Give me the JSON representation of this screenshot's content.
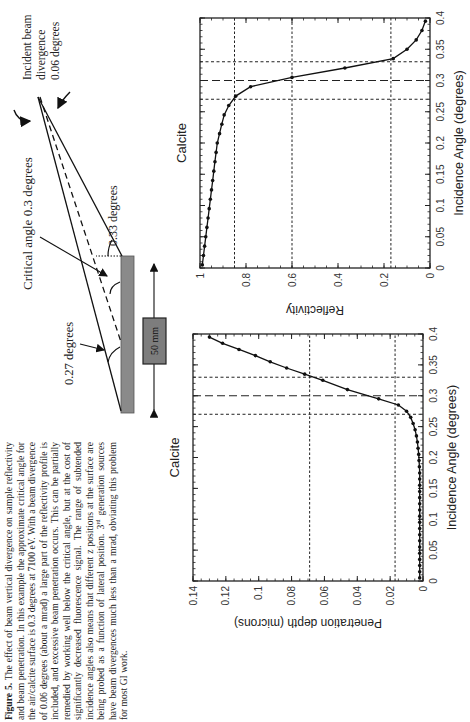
{
  "figure": {
    "label": "Figure 5.",
    "caption_lines": [
      "The effect of beam vertical divergence on sample",
      "reflectivity and beam penetration. In this example the",
      "approximate critical angle for the air/calcite surface is 0.3",
      "degrees at 7100 eV. With a beam divergence of 0.06 degrees",
      "(about a mrad) a large part of the reflectivity profile is included,",
      "and excessive beam penetration occurs. This can be partially",
      "remedied by working well below the critical angle, but at the",
      "cost of significantly decreased fluorescence signal. The range of",
      "subtended incidence angles also means that different z positions",
      "at the surface are being probed as a function of lateral position.",
      "generation sources have beam divergences much less than a",
      "mrad, obviating this problem for most GI work."
    ],
    "caption_superscript_prefix": "3",
    "caption_superscript": "rd"
  },
  "diagram": {
    "label_incident": [
      "Incident beam",
      "divergence",
      "0.06 degrees"
    ],
    "label_critical": "Critical angle  0.3 degrees",
    "label_033": "0.33 degrees",
    "label_027": "0.27 degrees",
    "label_size": "50 mm"
  },
  "chart_data": [
    {
      "type": "line",
      "title": "Calcite",
      "xlabel": "Incidence Angle (degrees)",
      "ylabel": "Reflectivity",
      "xlim": [
        0,
        0.4
      ],
      "ylim": [
        0,
        1
      ],
      "x_ticks": [
        "0",
        "0.05",
        "0.1",
        "0.15",
        "0.2",
        "0.25",
        "0.3",
        "0.35",
        "0.4"
      ],
      "y_ticks": [
        "0",
        "0.2",
        "0.4",
        "0.6",
        "0.8",
        "1"
      ],
      "grid": false,
      "markers": true,
      "x": [
        0.005,
        0.02,
        0.035,
        0.05,
        0.065,
        0.08,
        0.095,
        0.11,
        0.125,
        0.14,
        0.155,
        0.17,
        0.185,
        0.2,
        0.215,
        0.23,
        0.245,
        0.26,
        0.275,
        0.29,
        0.305,
        0.32,
        0.335,
        0.35,
        0.365,
        0.38,
        0.395
      ],
      "values": [
        0.99,
        0.985,
        0.98,
        0.975,
        0.97,
        0.965,
        0.96,
        0.955,
        0.95,
        0.945,
        0.94,
        0.935,
        0.93,
        0.925,
        0.915,
        0.905,
        0.895,
        0.875,
        0.845,
        0.78,
        0.6,
        0.37,
        0.16,
        0.1,
        0.06,
        0.035,
        0.02
      ],
      "reference_lines": {
        "vertical_dashed_angles": [
          0.27,
          0.3,
          0.33
        ],
        "horizontal_dotted_reflectivity": [
          0.85,
          0.6,
          0.17
        ]
      }
    },
    {
      "type": "line",
      "title": "Calcite",
      "xlabel": "Incidence Angle (degrees)",
      "ylabel": "Penetration depth (microns)",
      "xlim": [
        0,
        0.4
      ],
      "ylim": [
        0,
        0.14
      ],
      "x_ticks": [
        "0",
        "0.05",
        "0.1",
        "0.15",
        "0.2",
        "0.25",
        "0.3",
        "0.35",
        "0.4"
      ],
      "y_ticks": [
        "0",
        "0.02",
        "0.04",
        "0.06",
        "0.08",
        "0.1",
        "0.12",
        "0.14"
      ],
      "grid": false,
      "markers": true,
      "x": [
        0.005,
        0.015,
        0.025,
        0.035,
        0.045,
        0.055,
        0.065,
        0.075,
        0.085,
        0.095,
        0.105,
        0.115,
        0.125,
        0.135,
        0.145,
        0.155,
        0.165,
        0.175,
        0.185,
        0.195,
        0.205,
        0.215,
        0.225,
        0.235,
        0.245,
        0.255,
        0.265,
        0.275,
        0.285,
        0.295,
        0.31,
        0.325,
        0.335,
        0.345,
        0.355,
        0.365,
        0.375,
        0.385,
        0.395
      ],
      "values": [
        0.002,
        0.002,
        0.002,
        0.002,
        0.002,
        0.002,
        0.002,
        0.002,
        0.002,
        0.002,
        0.002,
        0.002,
        0.002,
        0.002,
        0.002,
        0.002,
        0.002,
        0.002,
        0.0022,
        0.0024,
        0.0026,
        0.003,
        0.0034,
        0.004,
        0.0048,
        0.006,
        0.0075,
        0.01,
        0.015,
        0.027,
        0.046,
        0.061,
        0.072,
        0.083,
        0.093,
        0.102,
        0.112,
        0.122,
        0.13
      ],
      "reference_lines": {
        "vertical_dashed_angles": [
          0.27,
          0.3,
          0.33
        ],
        "horizontal_dotted_depth": [
          0.017,
          0.069
        ]
      }
    }
  ]
}
